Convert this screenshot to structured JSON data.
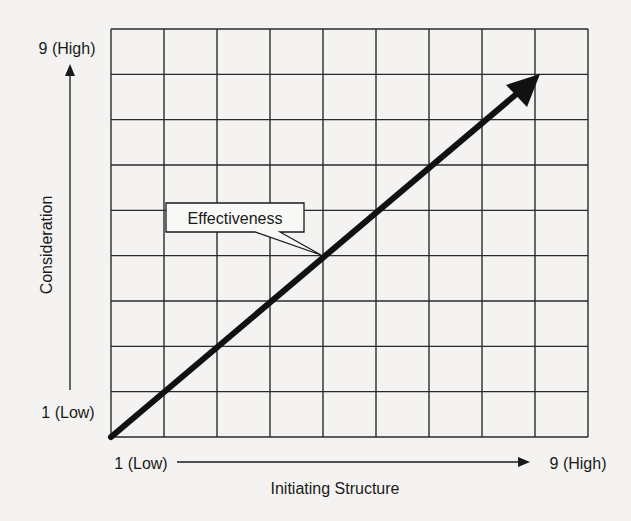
{
  "diagram": {
    "type": "grid-with-trend-arrow",
    "grid": {
      "columns": 9,
      "rows": 9
    },
    "y_axis": {
      "label": "Consideration",
      "high_label": "9 (High)",
      "low_label": "1 (Low)"
    },
    "x_axis": {
      "label": "Initiating Structure",
      "low_label": "1 (Low)",
      "high_label": "9 (High)"
    },
    "arrow": {
      "from": [
        1,
        1
      ],
      "to": [
        9,
        9
      ],
      "callout_label": "Effectiveness"
    },
    "colors": {
      "background": "#f4f3f1",
      "ink": "#1a1a1a"
    }
  }
}
